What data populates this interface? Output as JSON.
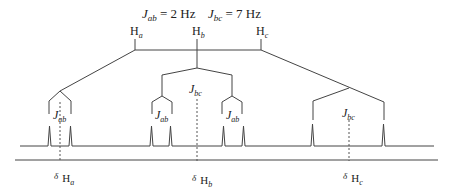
{
  "title": {
    "jab": {
      "sym": "J",
      "sub": "ab",
      "eq": " = 2 Hz"
    },
    "jbc": {
      "sym": "J",
      "sub": "bc",
      "eq": " = 7 Hz"
    }
  },
  "nuclei": [
    {
      "sym": "H",
      "sub": "a"
    },
    {
      "sym": "H",
      "sub": "b"
    },
    {
      "sym": "H",
      "sub": "c"
    }
  ],
  "couplings": {
    "ha": {
      "sym": "J",
      "sub": "ab"
    },
    "hb_outer": {
      "sym": "J",
      "sub": "bc"
    },
    "hb_left": {
      "sym": "J",
      "sub": "ab"
    },
    "hb_right": {
      "sym": "J",
      "sub": "ab"
    },
    "hc": {
      "sym": "J",
      "sub": "bc"
    }
  },
  "shifts": [
    {
      "delta": "δ",
      "sym": "H",
      "sub": "a"
    },
    {
      "delta": "δ",
      "sym": "H",
      "sub": "b"
    },
    {
      "delta": "δ",
      "sym": "H",
      "sub": "c"
    }
  ],
  "colors": {
    "line": "#444444",
    "text": "#222222"
  }
}
